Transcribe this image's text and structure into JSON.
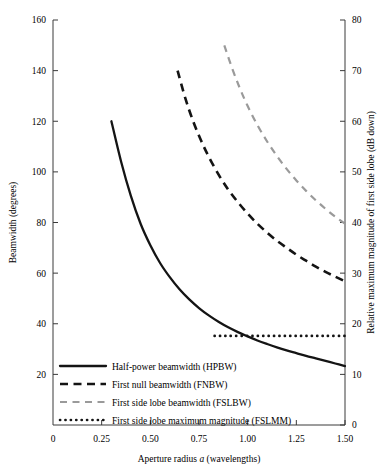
{
  "chart_data": {
    "type": "line",
    "title": "",
    "xlabel": "Aperture radius a (wavelengths)",
    "ylabel": "Beamwidth (degrees)",
    "y2label": "Relative maximum magnitude of first side lobe (dB down)",
    "xlim": [
      0,
      1.5
    ],
    "ylim": [
      0,
      160
    ],
    "y2lim": [
      0,
      80
    ],
    "grid": false,
    "legend_position": "lower-left",
    "xticks": [
      "0",
      "0.25",
      "0.50",
      "0.75",
      "1.00",
      "1.25",
      "1.50"
    ],
    "xtick_values": [
      0,
      0.25,
      0.5,
      0.75,
      1.0,
      1.25,
      1.5
    ],
    "yticks": [
      "20",
      "40",
      "60",
      "80",
      "100",
      "120",
      "140",
      "160"
    ],
    "ytick_values": [
      20,
      40,
      60,
      80,
      100,
      120,
      140,
      160
    ],
    "y2ticks": [
      "0",
      "10",
      "20",
      "30",
      "40",
      "50",
      "60",
      "70",
      "80"
    ],
    "y2tick_values": [
      0,
      10,
      20,
      30,
      40,
      50,
      60,
      70,
      80
    ],
    "series": [
      {
        "name": "Half-power beamwidth (HPBW)",
        "key": "hpbw",
        "axis": "left",
        "style": "solid",
        "color": "#141414",
        "x": [
          0.3,
          0.35,
          0.4,
          0.45,
          0.5,
          0.55,
          0.6,
          0.65,
          0.7,
          0.75,
          0.8,
          0.85,
          0.9,
          0.95,
          1.0,
          1.05,
          1.1,
          1.15,
          1.2,
          1.25,
          1.3,
          1.35,
          1.4,
          1.45,
          1.5
        ],
        "values": [
          120.0,
          104.0,
          90.5,
          79.5,
          71.0,
          64.0,
          58.4,
          53.6,
          49.6,
          46.2,
          43.3,
          40.8,
          38.6,
          36.7,
          35.0,
          33.4,
          32.0,
          30.7,
          29.5,
          28.4,
          27.3,
          26.3,
          25.3,
          24.3,
          23.3
        ]
      },
      {
        "name": "First null beamwidth (FNBW)",
        "key": "fnbw",
        "axis": "left",
        "style": "dashed",
        "color": "#141414",
        "x": [
          0.64,
          0.68,
          0.72,
          0.76,
          0.8,
          0.85,
          0.9,
          0.95,
          1.0,
          1.05,
          1.1,
          1.15,
          1.2,
          1.25,
          1.3,
          1.35,
          1.4,
          1.45,
          1.5
        ],
        "values": [
          140.0,
          129.0,
          120.0,
          112.5,
          106.0,
          99.0,
          93.0,
          88.0,
          83.5,
          79.5,
          76.0,
          72.8,
          70.0,
          67.3,
          64.9,
          62.6,
          60.5,
          58.6,
          56.8
        ]
      },
      {
        "name": "First side lobe beamwidth (FSLBW)",
        "key": "fslbw",
        "axis": "left",
        "style": "dashed-gray",
        "color": "#9a9a9a",
        "x": [
          0.88,
          0.92,
          0.96,
          1.0,
          1.05,
          1.1,
          1.15,
          1.2,
          1.25,
          1.3,
          1.35,
          1.4,
          1.45,
          1.5
        ],
        "values": [
          150.0,
          141.0,
          133.0,
          126.0,
          118.5,
          112.0,
          106.3,
          101.2,
          96.6,
          92.5,
          88.8,
          85.4,
          82.3,
          79.5
        ]
      },
      {
        "name": "First side lobe maximum magnitude (FSLMM)",
        "key": "fslmm",
        "axis": "right",
        "style": "dotted",
        "color": "#141414",
        "x": [
          0.83,
          0.9,
          1.0,
          1.1,
          1.2,
          1.3,
          1.4,
          1.5
        ],
        "values": [
          17.6,
          17.6,
          17.6,
          17.6,
          17.6,
          17.6,
          17.6,
          17.6
        ]
      }
    ]
  },
  "legend": {
    "items": [
      {
        "label": "Half-power beamwidth (HPBW)",
        "style": "solid"
      },
      {
        "label": "First null beamwidth (FNBW)",
        "style": "dashed"
      },
      {
        "label": "First side lobe beamwidth (FSLBW)",
        "style": "dashed-gray"
      },
      {
        "label": "First side lobe maximum magnitude (FSLMM)",
        "style": "dotted"
      }
    ]
  },
  "axes": {
    "x_title": "Aperture radius a (wavelengths)",
    "x_title_pre": "Aperture radius ",
    "x_title_italic": "a",
    "x_title_post": " (wavelengths)",
    "y_left_title": "Beamwidth (degrees)",
    "y_right_title": "Relative maximum magnitude of first side lobe (dB down)"
  }
}
